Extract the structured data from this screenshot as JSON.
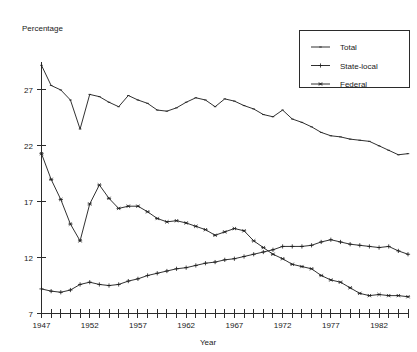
{
  "chart_data": {
    "type": "line",
    "title": "",
    "corner_label": "Percentage",
    "xlabel": "Year",
    "ylabel": "",
    "xlim": [
      1947,
      1985
    ],
    "ylim": [
      7,
      29.5
    ],
    "grid": false,
    "legend_position": "top-right",
    "x_tick_labels": [
      "1947",
      "1952",
      "1957",
      "1962",
      "1967",
      "1972",
      "1977",
      "1982"
    ],
    "x_tick_values": [
      1947,
      1952,
      1957,
      1962,
      1967,
      1972,
      1977,
      1982
    ],
    "x_minor_ticks_every": 1,
    "y_tick_labels": [
      "7",
      "12",
      "17",
      "22",
      "27"
    ],
    "y_tick_values": [
      7,
      12,
      17,
      22,
      27
    ],
    "x": [
      1947,
      1948,
      1949,
      1950,
      1951,
      1952,
      1953,
      1954,
      1955,
      1956,
      1957,
      1958,
      1959,
      1960,
      1961,
      1962,
      1963,
      1964,
      1965,
      1966,
      1967,
      1968,
      1969,
      1970,
      1971,
      1972,
      1973,
      1974,
      1975,
      1976,
      1977,
      1978,
      1979,
      1980,
      1981,
      1982,
      1983,
      1984,
      1985
    ],
    "series": [
      {
        "name": "Total",
        "marker": "dash",
        "values": [
          29.2,
          27.4,
          27.0,
          26.1,
          23.5,
          26.6,
          26.4,
          25.9,
          25.5,
          26.5,
          26.1,
          25.8,
          25.2,
          25.1,
          25.4,
          25.9,
          26.3,
          26.1,
          25.5,
          26.2,
          26.0,
          25.6,
          25.3,
          24.8,
          24.6,
          25.2,
          24.4,
          24.1,
          23.7,
          23.2,
          22.9,
          22.8,
          22.6,
          22.5,
          22.4,
          22.0,
          21.6,
          21.2,
          21.3
        ]
      },
      {
        "name": "State-local",
        "marker": "plus",
        "values": [
          9.2,
          9.0,
          8.9,
          9.1,
          9.6,
          9.8,
          9.6,
          9.5,
          9.6,
          9.9,
          10.1,
          10.4,
          10.6,
          10.8,
          11.0,
          11.1,
          11.3,
          11.5,
          11.6,
          11.8,
          11.9,
          12.1,
          12.3,
          12.5,
          12.7,
          13.0,
          13.0,
          13.0,
          13.1,
          13.4,
          13.6,
          13.4,
          13.2,
          13.1,
          13.0,
          12.9,
          13.0,
          12.6,
          12.3
        ]
      },
      {
        "name": "Federal",
        "marker": "star",
        "values": [
          21.3,
          19.0,
          17.2,
          15.0,
          13.5,
          16.8,
          18.5,
          17.3,
          16.4,
          16.6,
          16.6,
          16.1,
          15.5,
          15.2,
          15.3,
          15.1,
          14.8,
          14.5,
          14.0,
          14.3,
          14.6,
          14.4,
          13.5,
          12.9,
          12.3,
          11.9,
          11.4,
          11.2,
          11.0,
          10.4,
          10.0,
          9.8,
          9.3,
          8.8,
          8.6,
          8.7,
          8.6,
          8.6,
          8.5
        ]
      }
    ]
  },
  "legend": {
    "items": [
      {
        "label": "Total",
        "marker": "dash"
      },
      {
        "label": "State-local",
        "marker": "plus"
      },
      {
        "label": "Federal",
        "marker": "star"
      }
    ]
  }
}
